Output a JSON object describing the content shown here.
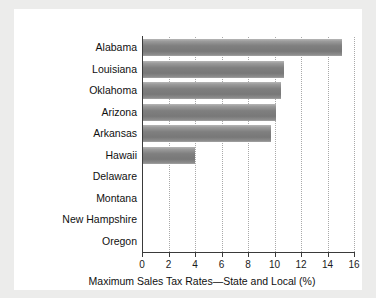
{
  "chart_data": {
    "type": "bar",
    "orientation": "horizontal",
    "title": "",
    "xlabel": "Maximum Sales Tax Rates—State and Local (%)",
    "ylabel": "",
    "xlim": [
      0,
      16
    ],
    "xticks": [
      0,
      2,
      4,
      6,
      8,
      10,
      12,
      14,
      16
    ],
    "xtick_labels": [
      "0",
      "2",
      "4",
      "6",
      "8",
      "10",
      "12",
      "14",
      "16"
    ],
    "grid": "vertical-dotted",
    "legend": "none",
    "categories": [
      "Alabama",
      "Louisiana",
      "Oklahoma",
      "Arizona",
      "Arkansas",
      "Hawaii",
      "Delaware",
      "Montana",
      "New Hampshire",
      "Oregon"
    ],
    "values": [
      15.1,
      10.75,
      10.5,
      10.15,
      9.75,
      4.0,
      0,
      0,
      0,
      0
    ],
    "bar_color": "#828282",
    "axis_color": "#3a3a3a",
    "grid_color": "#a9a9a9",
    "background": "#ffffff",
    "page_background": "#ececeb"
  }
}
